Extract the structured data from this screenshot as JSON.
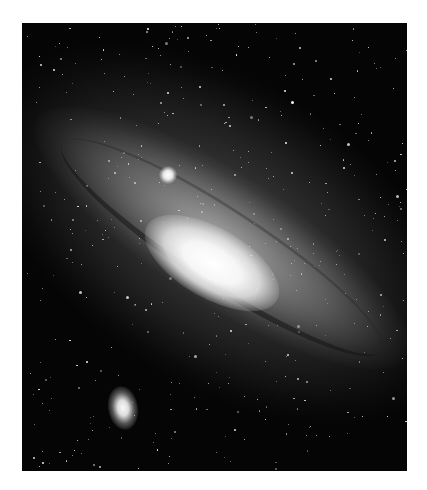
{
  "image": {
    "subject": "Andromeda Galaxy",
    "alt": "Spiral galaxy seen at an oblique angle with bright core, dust lanes and two small companion galaxies against a dense starfield",
    "colors": {
      "background_page": "#ffffff",
      "sky": "#050505",
      "core": "#ffffff",
      "arms": "#b4b4b4"
    },
    "features": [
      {
        "name": "galaxy-core",
        "label": "Bright galactic core"
      },
      {
        "name": "companion-m32",
        "label": "Compact companion galaxy (upper)"
      },
      {
        "name": "companion-m110",
        "label": "Elliptical companion galaxy (lower left)"
      }
    ],
    "star_seed": 1337,
    "star_count": 420
  }
}
